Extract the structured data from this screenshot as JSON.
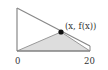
{
  "diagram": {
    "point_label": "(x, f(x))",
    "axis_labels": {
      "left": "0",
      "right": "20"
    },
    "colors": {
      "line": "#888888",
      "fill": "#dddddd",
      "point": "#111111",
      "text": "#333333"
    }
  }
}
